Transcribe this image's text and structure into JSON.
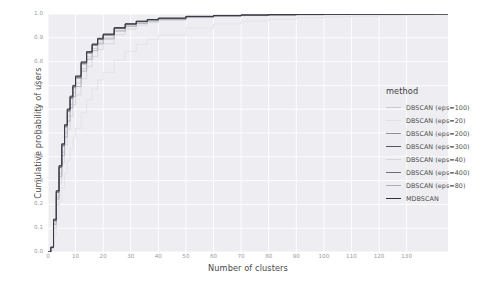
{
  "chart_data": {
    "type": "line",
    "title": "",
    "subtitle": "",
    "xlabel": "Number of clusters",
    "ylabel": "Cumulative probability of users",
    "xlim": [
      0,
      145
    ],
    "ylim": [
      0.0,
      1.0
    ],
    "grid": true,
    "legend_position": "right",
    "legend_title": "method",
    "xticks": [
      0,
      10,
      20,
      30,
      40,
      50,
      60,
      70,
      80,
      90,
      100,
      110,
      120,
      130
    ],
    "xticklabels": [
      "0",
      "10",
      "20",
      "30",
      "40",
      "50",
      "60",
      "70",
      "80",
      "90",
      "100",
      "110",
      "120",
      "130"
    ],
    "yticks": [
      0.0,
      0.1,
      0.2,
      0.3,
      0.4,
      0.5,
      0.6,
      0.7,
      0.8,
      0.9,
      1.0
    ],
    "yticklabels": [
      "0.0",
      "0.1",
      "0.2",
      "0.3",
      "0.4",
      "0.5",
      "0.6",
      "0.7",
      "0.8",
      "0.9",
      "1.0"
    ],
    "x": [
      0,
      1,
      2,
      3,
      4,
      5,
      6,
      7,
      8,
      9,
      10,
      12,
      14,
      16,
      18,
      20,
      24,
      28,
      32,
      36,
      40,
      50,
      60,
      70,
      80,
      90,
      100,
      110,
      120,
      130,
      140
    ],
    "series": [
      {
        "name": "DBSCAN (eps=100)",
        "color": "#c9c9cf",
        "values": [
          0.0,
          0.02,
          0.12,
          0.23,
          0.33,
          0.42,
          0.5,
          0.57,
          0.62,
          0.67,
          0.71,
          0.77,
          0.82,
          0.855,
          0.88,
          0.9,
          0.932,
          0.951,
          0.963,
          0.972,
          0.978,
          0.987,
          0.991,
          0.994,
          0.996,
          0.997,
          0.998,
          0.9985,
          0.999,
          0.9995,
          1.0
        ]
      },
      {
        "name": "DBSCAN (eps=20)",
        "color": "#e2e2e6",
        "values": [
          0.0,
          0.01,
          0.07,
          0.14,
          0.21,
          0.27,
          0.33,
          0.385,
          0.435,
          0.48,
          0.52,
          0.585,
          0.64,
          0.685,
          0.723,
          0.755,
          0.805,
          0.843,
          0.872,
          0.894,
          0.911,
          0.941,
          0.958,
          0.97,
          0.978,
          0.984,
          0.988,
          0.991,
          0.994,
          0.996,
          0.999
        ]
      },
      {
        "name": "DBSCAN (eps=200)",
        "color": "#8f8f98",
        "values": [
          0.0,
          0.02,
          0.13,
          0.25,
          0.355,
          0.445,
          0.525,
          0.59,
          0.645,
          0.69,
          0.73,
          0.79,
          0.835,
          0.868,
          0.892,
          0.911,
          0.939,
          0.957,
          0.968,
          0.975,
          0.981,
          0.989,
          0.993,
          0.995,
          0.997,
          0.998,
          0.9985,
          0.999,
          0.9993,
          0.9997,
          1.0
        ]
      },
      {
        "name": "DBSCAN (eps=300)",
        "color": "#55555e",
        "values": [
          0.0,
          0.02,
          0.135,
          0.255,
          0.36,
          0.452,
          0.532,
          0.598,
          0.652,
          0.697,
          0.737,
          0.796,
          0.84,
          0.872,
          0.896,
          0.914,
          0.941,
          0.958,
          0.969,
          0.976,
          0.982,
          0.99,
          0.993,
          0.996,
          0.997,
          0.998,
          0.999,
          0.9992,
          0.9995,
          0.9998,
          1.0
        ]
      },
      {
        "name": "DBSCAN (eps=40)",
        "color": "#d5d5da",
        "values": [
          0.0,
          0.015,
          0.1,
          0.2,
          0.29,
          0.375,
          0.45,
          0.515,
          0.57,
          0.618,
          0.66,
          0.728,
          0.78,
          0.82,
          0.851,
          0.875,
          0.913,
          0.937,
          0.953,
          0.964,
          0.973,
          0.985,
          0.99,
          0.993,
          0.995,
          0.9965,
          0.9975,
          0.998,
          0.9987,
          0.9993,
          1.0
        ]
      },
      {
        "name": "DBSCAN (eps=400)",
        "color": "#6e6e77",
        "values": [
          0.0,
          0.02,
          0.132,
          0.252,
          0.357,
          0.449,
          0.529,
          0.595,
          0.649,
          0.694,
          0.734,
          0.793,
          0.838,
          0.87,
          0.894,
          0.912,
          0.94,
          0.957,
          0.968,
          0.976,
          0.981,
          0.989,
          0.993,
          0.995,
          0.997,
          0.998,
          0.9987,
          0.9991,
          0.9994,
          0.9997,
          1.0
        ]
      },
      {
        "name": "DBSCAN (eps=80)",
        "color": "#aeaeb6",
        "values": [
          0.0,
          0.018,
          0.115,
          0.222,
          0.318,
          0.405,
          0.483,
          0.55,
          0.605,
          0.653,
          0.695,
          0.76,
          0.81,
          0.846,
          0.874,
          0.895,
          0.928,
          0.948,
          0.96,
          0.97,
          0.977,
          0.986,
          0.991,
          0.994,
          0.996,
          0.997,
          0.998,
          0.9985,
          0.999,
          0.9995,
          1.0
        ]
      },
      {
        "name": "MDBSCAN",
        "color": "#31313a",
        "values": [
          0.0,
          0.02,
          0.138,
          0.258,
          0.363,
          0.455,
          0.535,
          0.601,
          0.655,
          0.7,
          0.74,
          0.799,
          0.842,
          0.874,
          0.898,
          0.916,
          0.943,
          0.959,
          0.97,
          0.977,
          0.983,
          0.99,
          0.994,
          0.996,
          0.9975,
          0.9983,
          0.999,
          0.9993,
          0.9996,
          0.9998,
          1.0
        ]
      }
    ]
  },
  "legend": {
    "title": "method",
    "entries": [
      {
        "label": "DBSCAN (eps=100)",
        "color": "#c9c9cf"
      },
      {
        "label": "DBSCAN (eps=20)",
        "color": "#e2e2e6"
      },
      {
        "label": "DBSCAN (eps=200)",
        "color": "#8f8f98"
      },
      {
        "label": "DBSCAN (eps=300)",
        "color": "#55555e"
      },
      {
        "label": "DBSCAN (eps=40)",
        "color": "#d5d5da"
      },
      {
        "label": "DBSCAN (eps=400)",
        "color": "#6e6e77"
      },
      {
        "label": "DBSCAN (eps=80)",
        "color": "#aeaeb6"
      },
      {
        "label": "MDBSCAN",
        "color": "#31313a"
      }
    ]
  },
  "style": {
    "panel_background": "#ededf2",
    "grid_color": "#ffffff",
    "figure_background": "#ffffff",
    "tick_label_color": "#9a9aa0",
    "axis_label_color": "#4a4a4a"
  }
}
